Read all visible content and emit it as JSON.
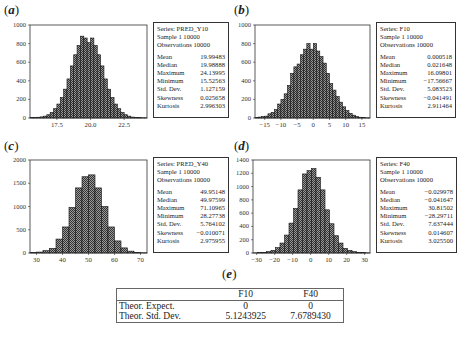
{
  "panels": {
    "a": {
      "label": "a"
    },
    "b": {
      "label": "b"
    },
    "c": {
      "label": "c"
    },
    "d": {
      "label": "d"
    },
    "e": {
      "label": "e"
    }
  },
  "stats": {
    "a": {
      "series": "Series: PRED_Y10",
      "sample": "Sample 1 10000",
      "obs": "Observations 10000",
      "rows": [
        [
          "Mean",
          "19.99483"
        ],
        [
          "Median",
          "19.98888"
        ],
        [
          "Maximum",
          "24.13995"
        ],
        [
          "Minimum",
          "15.52563"
        ],
        [
          "Std. Dev.",
          "1.127159"
        ],
        [
          "Skewness",
          "0.025658"
        ],
        [
          "Kurtosis",
          "2.996303"
        ]
      ]
    },
    "b": {
      "series": "Series: F10",
      "sample": "Sample 1 10000",
      "obs": "Observations 10000",
      "rows": [
        [
          "Mean",
          "0.000518"
        ],
        [
          "Median",
          "0.021648"
        ],
        [
          "Maximum",
          "16.09801"
        ],
        [
          "Minimum",
          "−17.56667"
        ],
        [
          "Std. Dev.",
          "5.083523"
        ],
        [
          "Skewness",
          "−0.041491"
        ],
        [
          "Kurtosis",
          "2.911464"
        ]
      ]
    },
    "c": {
      "series": "Series: PRED_Y40",
      "sample": "Sample 1 10000",
      "obs": "Observations 10000",
      "rows": [
        [
          "Mean",
          "49.95148"
        ],
        [
          "Median",
          "49.97599"
        ],
        [
          "Maximum",
          "71.10965"
        ],
        [
          "Minimum",
          "28.27738"
        ],
        [
          "Std. Dev.",
          "5.764102"
        ],
        [
          "Skewness",
          "−0.010071"
        ],
        [
          "Kurtosis",
          "2.975955"
        ]
      ]
    },
    "d": {
      "series": "Series: F40",
      "sample": "Sample 1 10000",
      "obs": "Observations 10000",
      "rows": [
        [
          "Mean",
          "−0.029978"
        ],
        [
          "Median",
          "−0.041647"
        ],
        [
          "Maximum",
          "30.81502"
        ],
        [
          "Minimum",
          "−28.29711"
        ],
        [
          "Std. Dev.",
          "7.637444"
        ],
        [
          "Skewness",
          "0.014607"
        ],
        [
          "Kurtosis",
          "3.025500"
        ]
      ]
    }
  },
  "theor_table": {
    "headers": [
      "",
      "F10",
      "F40"
    ],
    "rows": [
      [
        "Theor. Expect.",
        "0",
        "0"
      ],
      [
        "Theor. Std. Dev.",
        "5.1243925",
        "7.6789430"
      ]
    ]
  },
  "chart_data": [
    {
      "id": "a",
      "type": "bar",
      "title": "PRED_Y10 histogram",
      "xlabel": "",
      "ylabel": "",
      "ylim": [
        0,
        1000
      ],
      "yticks": [
        0,
        200,
        400,
        600,
        800,
        1000
      ],
      "xlim": [
        15.5,
        24.2
      ],
      "xticks": [
        17.5,
        20.0,
        22.5
      ],
      "xtick_labels": [
        "17.5",
        "20.0",
        "22.5"
      ],
      "bin_start": 15.5,
      "bin_width": 0.25,
      "values": [
        5,
        5,
        8,
        12,
        20,
        35,
        60,
        100,
        150,
        220,
        310,
        420,
        560,
        680,
        780,
        880,
        860,
        810,
        860,
        780,
        680,
        560,
        420,
        310,
        220,
        150,
        100,
        60,
        35,
        20,
        10,
        6,
        4,
        3,
        2
      ]
    },
    {
      "id": "b",
      "type": "bar",
      "title": "F10 histogram",
      "xlabel": "",
      "ylabel": "",
      "ylim": [
        0,
        1000
      ],
      "yticks": [
        0,
        200,
        400,
        600,
        800,
        1000
      ],
      "xlim": [
        -18,
        17.5
      ],
      "xticks": [
        -15,
        -10,
        -5,
        0,
        5,
        10,
        15
      ],
      "xtick_labels": [
        "−15",
        "−10",
        "−5",
        "0",
        "5",
        "10",
        "15"
      ],
      "bin_start": -18,
      "bin_width": 1,
      "values": [
        5,
        10,
        15,
        20,
        45,
        60,
        90,
        150,
        200,
        260,
        350,
        480,
        550,
        580,
        680,
        740,
        800,
        740,
        800,
        720,
        660,
        590,
        480,
        370,
        300,
        230,
        170,
        120,
        80,
        50,
        30,
        15,
        8,
        5,
        2,
        1
      ]
    },
    {
      "id": "c",
      "type": "bar",
      "title": "PRED_Y40 histogram",
      "xlabel": "",
      "ylabel": "",
      "ylim": [
        0,
        2000
      ],
      "yticks": [
        0,
        500,
        1000,
        1500,
        2000
      ],
      "xlim": [
        27.5,
        72.5
      ],
      "xticks": [
        30,
        40,
        50,
        60,
        70
      ],
      "xtick_labels": [
        "30",
        "40",
        "50",
        "60",
        "70"
      ],
      "bin_start": 27.5,
      "bin_width": 2.5,
      "values": [
        10,
        20,
        50,
        100,
        300,
        560,
        980,
        1400,
        1640,
        1680,
        1400,
        1000,
        560,
        260,
        110,
        40,
        15,
        5
      ]
    },
    {
      "id": "d",
      "type": "bar",
      "title": "F40 histogram",
      "xlabel": "",
      "ylabel": "",
      "ylim": [
        0,
        1400
      ],
      "yticks": [
        0,
        200,
        400,
        600,
        800,
        1000,
        1200,
        1400
      ],
      "xlim": [
        -32,
        33
      ],
      "xticks": [
        -30,
        -20,
        -10,
        0,
        10,
        20,
        30
      ],
      "xtick_labels": [
        "−30",
        "−20",
        "−10",
        "0",
        "10",
        "20",
        "30"
      ],
      "bin_start": -32,
      "bin_width": 2.5,
      "values": [
        2,
        5,
        10,
        20,
        40,
        80,
        150,
        270,
        450,
        670,
        950,
        1190,
        1240,
        1270,
        1140,
        950,
        650,
        440,
        260,
        150,
        70,
        40,
        20,
        10,
        5,
        2
      ]
    }
  ]
}
